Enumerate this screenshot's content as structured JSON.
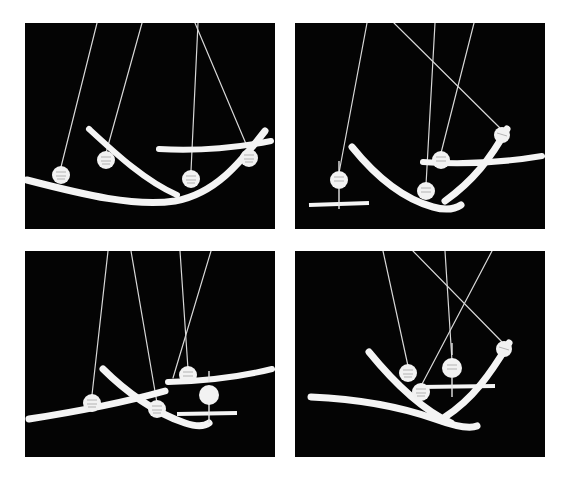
{
  "figure": {
    "description": "Four black-background stroboscopic photographs arranged in a 2x2 grid, each showing white pendulum bobs on suspension threads together with curved white track rails and horizontal reference bars.",
    "panel_count": 4,
    "background_color": "#ffffff",
    "panel_background_color": "#040404",
    "object_color": "#f4f4f4",
    "thread_color": "#d8d8d8",
    "layout": {
      "columns": 2,
      "rows": 2,
      "panel_width": 250,
      "panel_height": 206,
      "panel_gap_x": 20,
      "panel_gap_y": 22,
      "margin_left": 25,
      "margin_top": 23
    }
  },
  "panels": [
    {
      "id": "panel-top-left",
      "label": "a",
      "x": 25,
      "y": 23,
      "width": 250,
      "height": 206,
      "threads": [
        {
          "name": "thread-1",
          "x1": 72,
          "y1": 0,
          "x2": 36,
          "y2": 144
        },
        {
          "name": "thread-2",
          "x1": 117,
          "y1": 0,
          "x2": 81,
          "y2": 130
        },
        {
          "name": "thread-3",
          "x1": 173,
          "y1": 0,
          "x2": 166,
          "y2": 148
        },
        {
          "name": "thread-4",
          "x1": 170,
          "y1": 0,
          "x2": 224,
          "y2": 128
        }
      ],
      "balls": [
        {
          "name": "bob-1",
          "cx": 36,
          "cy": 152,
          "r": 9
        },
        {
          "name": "bob-2",
          "cx": 81,
          "cy": 137,
          "r": 9
        },
        {
          "name": "bob-3",
          "cx": 166,
          "cy": 156,
          "r": 9
        },
        {
          "name": "bob-4",
          "cx": 224,
          "cy": 135,
          "r": 9
        }
      ],
      "rails": [
        {
          "name": "rail-long-concave",
          "path": "M 2 157 C 60 172 110 184 150 178 C 190 171 215 140 240 108"
        },
        {
          "name": "rail-short-concave",
          "path": "M 64 106 C 90 130 120 158 152 172"
        },
        {
          "name": "rail-flat-right",
          "path": "M 134 126 C 170 128 205 126 246 118"
        }
      ],
      "bars": []
    },
    {
      "id": "panel-top-right",
      "label": "b",
      "x": 295,
      "y": 23,
      "width": 250,
      "height": 206,
      "threads": [
        {
          "name": "thread-1",
          "x1": 72,
          "y1": 0,
          "x2": 44,
          "y2": 150
        },
        {
          "name": "thread-2",
          "x1": 99,
          "y1": 0,
          "x2": 207,
          "y2": 107
        },
        {
          "name": "thread-3",
          "x1": 140,
          "y1": 0,
          "x2": 131,
          "y2": 162
        },
        {
          "name": "thread-4",
          "x1": 179,
          "y1": 0,
          "x2": 146,
          "y2": 130
        }
      ],
      "balls": [
        {
          "name": "bob-1",
          "cx": 44,
          "cy": 157,
          "r": 9
        },
        {
          "name": "bob-2",
          "cx": 131,
          "cy": 168,
          "r": 9
        },
        {
          "name": "bob-3",
          "cx": 146,
          "cy": 137,
          "r": 9
        },
        {
          "name": "bob-4",
          "cx": 207,
          "cy": 112,
          "r": 8
        }
      ],
      "rails": [
        {
          "name": "rail-long-concave",
          "path": "M 57 124 C 78 150 105 175 138 184 C 152 188 160 186 166 182"
        },
        {
          "name": "rail-rising-right",
          "path": "M 150 178 C 178 158 196 135 212 106"
        },
        {
          "name": "rail-flat-right",
          "path": "M 128 139 C 168 142 205 140 247 133"
        }
      ],
      "bars": [
        {
          "name": "reference-bar-1",
          "x1": 14,
          "y1": 182,
          "x2": 74,
          "y2": 180
        }
      ],
      "markers": [
        {
          "name": "plumb-tick-upper",
          "x1": 44,
          "y1": 138,
          "x2": 44,
          "y2": 148
        },
        {
          "name": "plumb-tick-lower",
          "x1": 44,
          "y1": 166,
          "x2": 44,
          "y2": 186
        }
      ]
    },
    {
      "id": "panel-bottom-left",
      "label": "c",
      "x": 25,
      "y": 251,
      "width": 250,
      "height": 206,
      "threads": [
        {
          "name": "thread-1",
          "x1": 83,
          "y1": 0,
          "x2": 67,
          "y2": 144
        },
        {
          "name": "thread-2",
          "x1": 106,
          "y1": 0,
          "x2": 132,
          "y2": 152
        },
        {
          "name": "thread-3",
          "x1": 155,
          "y1": 0,
          "x2": 163,
          "y2": 118
        },
        {
          "name": "thread-4",
          "x1": 186,
          "y1": 0,
          "x2": 148,
          "y2": 127
        }
      ],
      "balls": [
        {
          "name": "bob-1",
          "cx": 67,
          "cy": 152,
          "r": 9
        },
        {
          "name": "bob-2",
          "cx": 132,
          "cy": 158,
          "r": 9
        },
        {
          "name": "bob-3",
          "cx": 163,
          "cy": 124,
          "r": 9
        },
        {
          "name": "bob-4",
          "cx": 184,
          "cy": 144,
          "r": 10
        }
      ],
      "rails": [
        {
          "name": "rail-long-concave",
          "path": "M 4 168 C 56 160 104 150 140 140"
        },
        {
          "name": "rail-short-concave",
          "path": "M 78 118 C 100 140 130 162 160 172 C 172 176 180 175 184 172"
        },
        {
          "name": "rail-flat-right",
          "path": "M 143 131 C 185 130 215 126 247 118"
        }
      ],
      "bars": [
        {
          "name": "reference-bar-1",
          "x1": 152,
          "y1": 163,
          "x2": 212,
          "y2": 162
        }
      ],
      "markers": [
        {
          "name": "plumb-tick-upper",
          "x1": 184,
          "y1": 120,
          "x2": 184,
          "y2": 131
        },
        {
          "name": "plumb-tick-lower",
          "x1": 184,
          "y1": 153,
          "x2": 184,
          "y2": 172
        }
      ]
    },
    {
      "id": "panel-bottom-right",
      "label": "d",
      "x": 295,
      "y": 251,
      "width": 250,
      "height": 206,
      "threads": [
        {
          "name": "thread-1",
          "x1": 88,
          "y1": 0,
          "x2": 113,
          "y2": 115
        },
        {
          "name": "thread-2",
          "x1": 118,
          "y1": 0,
          "x2": 209,
          "y2": 93
        },
        {
          "name": "thread-3",
          "x1": 150,
          "y1": 0,
          "x2": 157,
          "y2": 110
        },
        {
          "name": "thread-4",
          "x1": 197,
          "y1": 0,
          "x2": 126,
          "y2": 135
        }
      ],
      "balls": [
        {
          "name": "bob-1",
          "cx": 113,
          "cy": 122,
          "r": 9
        },
        {
          "name": "bob-2",
          "cx": 126,
          "cy": 141,
          "r": 9
        },
        {
          "name": "bob-3",
          "cx": 157,
          "cy": 117,
          "r": 10
        },
        {
          "name": "bob-4",
          "cx": 209,
          "cy": 98,
          "r": 8
        }
      ],
      "rails": [
        {
          "name": "rail-long-concave",
          "path": "M 16 146 C 62 148 106 156 140 168 C 162 176 175 178 182 175"
        },
        {
          "name": "rail-rising-right",
          "path": "M 74 101 C 96 128 126 158 156 172"
        },
        {
          "name": "rail-rising-far-right",
          "path": "M 150 166 C 178 148 196 122 214 92"
        }
      ],
      "bars": [
        {
          "name": "reference-bar-1",
          "x1": 125,
          "y1": 136,
          "x2": 200,
          "y2": 135
        }
      ],
      "markers": [
        {
          "name": "plumb-tick-upper",
          "x1": 157,
          "y1": 92,
          "x2": 157,
          "y2": 104
        },
        {
          "name": "plumb-tick-lower",
          "x1": 157,
          "y1": 127,
          "x2": 157,
          "y2": 146
        }
      ]
    }
  ]
}
